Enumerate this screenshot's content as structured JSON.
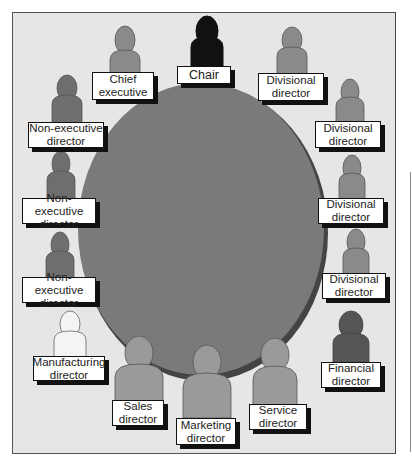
{
  "diagram": {
    "type": "boardroom-seating",
    "table_color": "#7a7a7a",
    "background_color": "#e6e6e6",
    "seats": [
      {
        "id": "chair",
        "label": "Chair",
        "figure_color": "#111111"
      },
      {
        "id": "chief-executive",
        "label": "Chief\nexecutive",
        "figure_color": "#8a8a8a"
      },
      {
        "id": "divisional-director-1",
        "label": "Divisional\ndirector",
        "figure_color": "#8a8a8a"
      },
      {
        "id": "non-executive-director-1",
        "label": "Non-executive\ndirector",
        "figure_color": "#6e6e6e"
      },
      {
        "id": "divisional-director-2",
        "label": "Divisional\ndirector",
        "figure_color": "#8a8a8a"
      },
      {
        "id": "non-executive-director-2",
        "label": "Non-executive\ndirector",
        "figure_color": "#6e6e6e"
      },
      {
        "id": "divisional-director-3",
        "label": "Divisional\ndirector",
        "figure_color": "#8a8a8a"
      },
      {
        "id": "non-executive-director-3",
        "label": "Non-executive\ndirector",
        "figure_color": "#6e6e6e"
      },
      {
        "id": "divisional-director-4",
        "label": "Divisional\ndirector",
        "figure_color": "#8a8a8a"
      },
      {
        "id": "manufacturing-director",
        "label": "Manufacturing\ndirector",
        "figure_color": "#f4f4f4"
      },
      {
        "id": "financial-director",
        "label": "Financial\ndirector",
        "figure_color": "#555555"
      },
      {
        "id": "sales-director",
        "label": "Sales\ndirector",
        "figure_color": "#9a9a9a"
      },
      {
        "id": "marketing-director",
        "label": "Marketing\ndirector",
        "figure_color": "#9a9a9a"
      },
      {
        "id": "service-director",
        "label": "Service\ndirector",
        "figure_color": "#9a9a9a"
      }
    ]
  }
}
